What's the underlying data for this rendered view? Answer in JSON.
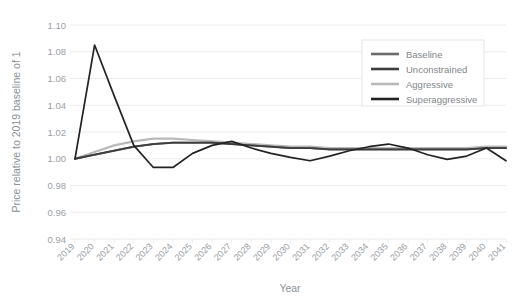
{
  "chart_data": {
    "type": "line",
    "title": "",
    "xlabel": "Year",
    "ylabel": "Price relative to 2019 baseline of 1",
    "ylim": [
      0.94,
      1.1
    ],
    "yticks": [
      "0.94",
      "0.96",
      "0.98",
      "1.00",
      "1.02",
      "1.04",
      "1.06",
      "1.08",
      "1.10"
    ],
    "grid": true,
    "legend_position": "top-right",
    "categories": [
      "2019",
      "2020",
      "2021",
      "2022",
      "2023",
      "2024",
      "2025",
      "2026",
      "2027",
      "2028",
      "2029",
      "2030",
      "2031",
      "2032",
      "2033",
      "2034",
      "2035",
      "2036",
      "2037",
      "2038",
      "2039",
      "2040",
      "2041"
    ],
    "series": [
      {
        "name": "Baseline",
        "color": "#6b6b6b",
        "values": [
          1.0,
          1.003,
          1.006,
          1.009,
          1.011,
          1.012,
          1.012,
          1.012,
          1.011,
          1.01,
          1.009,
          1.008,
          1.008,
          1.007,
          1.007,
          1.007,
          1.007,
          1.007,
          1.007,
          1.007,
          1.007,
          1.008,
          1.008
        ]
      },
      {
        "name": "Unconstrained",
        "color": "#3d3d3d",
        "values": [
          1.0,
          1.003,
          1.006,
          1.009,
          1.011,
          1.012,
          1.012,
          1.012,
          1.011,
          1.01,
          1.009,
          1.008,
          1.008,
          1.007,
          1.007,
          1.007,
          1.007,
          1.007,
          1.007,
          1.007,
          1.007,
          1.008,
          1.008
        ]
      },
      {
        "name": "Aggressive",
        "color": "#b9b9b9",
        "values": [
          1.0,
          1.005,
          1.01,
          1.013,
          1.015,
          1.015,
          1.014,
          1.013,
          1.012,
          1.011,
          1.01,
          1.009,
          1.009,
          1.008,
          1.008,
          1.008,
          1.008,
          1.008,
          1.008,
          1.008,
          1.008,
          1.009,
          1.009
        ]
      },
      {
        "name": "Superaggressive",
        "color": "#232323",
        "values": [
          1.0,
          1.085,
          1.047,
          1.01,
          0.9935,
          0.9935,
          1.004,
          1.01,
          1.013,
          1.008,
          1.004,
          1.001,
          0.9985,
          1.002,
          1.006,
          1.009,
          1.011,
          1.008,
          1.003,
          0.9995,
          1.002,
          1.008,
          0.9985
        ]
      }
    ]
  },
  "axes": {
    "x_title": "Year",
    "y_title": "Price relative to 2019 baseline of 1"
  },
  "legend": {
    "items": [
      {
        "label": "Baseline"
      },
      {
        "label": "Unconstrained"
      },
      {
        "label": "Aggressive"
      },
      {
        "label": "Superaggressive"
      }
    ]
  }
}
